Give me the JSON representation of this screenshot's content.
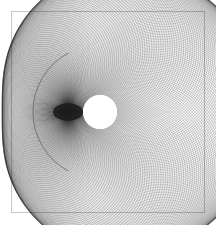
{
  "page": {
    "width": 216,
    "height": 225,
    "background_color": "#ffffff"
  },
  "frame": {
    "name": "figure-border",
    "left": 11,
    "top": 11,
    "width": 194,
    "height": 202,
    "border_color": "#c8c8c8",
    "border_width": 1,
    "fill_color": "#ffffff"
  },
  "chart_data": {
    "type": "scatter",
    "title": "",
    "subtitle": "",
    "xlabel": "",
    "ylabel": "",
    "grid": false,
    "legend": null,
    "annotations": [],
    "xlim": [
      11,
      205
    ],
    "ylim": [
      11,
      213
    ],
    "tick_labels_x": [],
    "tick_labels_y": [],
    "geometry": {
      "base_circle": {
        "name": "generating-circle",
        "cx": 100.0,
        "cy": 112.0,
        "r": 65.0
      },
      "fixed_point": {
        "name": "cusp-point",
        "x": 68.0,
        "y": 112.0
      },
      "family_count": 260,
      "angle_start_deg": 0,
      "angle_end_deg": 360,
      "stroke_color": "#1a1a1a",
      "stroke_width": 0.32,
      "stroke_opacity": 0.62
    },
    "highlight_arc": {
      "name": "outer-left-arc",
      "cx": 100.0,
      "cy": 112.0,
      "r": 67.0,
      "stroke_color": "#5a5a5a",
      "stroke_width": 0.7,
      "start_deg": 118,
      "end_deg": 242
    },
    "center_hole": {
      "name": "central-white-disc",
      "cx": 100.0,
      "cy": 112.0,
      "r": 17.0,
      "fill_color": "#ffffff"
    },
    "cusp_lens": {
      "name": "dark-lens",
      "cx": 68.0,
      "cy": 112.0,
      "rx": 15.0,
      "ry": 9.0,
      "fill_color": "#1d1d1d",
      "fill_opacity": 0.9
    },
    "extent": {
      "left": 34,
      "right": 185,
      "top": 23,
      "bottom": 198
    }
  }
}
